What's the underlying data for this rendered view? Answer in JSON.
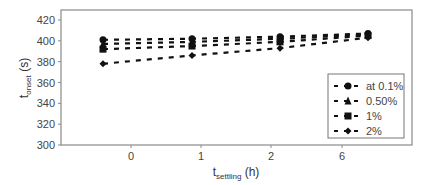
{
  "chart_data": {
    "type": "line",
    "title": "",
    "xlabel": "t_settling (h)",
    "xlabel_main": "t",
    "xlabel_sub": "settling",
    "xlabel_unit": " (h)",
    "ylabel": "t_onset (s)",
    "ylabel_main": "t",
    "ylabel_sub": "onset",
    "ylabel_unit": " (s)",
    "categories": [
      "0",
      "1",
      "2",
      "6"
    ],
    "x_tick_labels": [
      "0",
      "1",
      "2",
      "6"
    ],
    "y_ticks": [
      300,
      320,
      340,
      360,
      380,
      400,
      420
    ],
    "ylim": [
      300,
      425
    ],
    "grid": false,
    "legend_position": "right-center",
    "series": [
      {
        "name": "at 0.1%",
        "marker": "circle",
        "values": [
          401,
          402,
          404,
          407
        ]
      },
      {
        "name": "0.50%",
        "marker": "triangle",
        "values": [
          397,
          399,
          402,
          406
        ]
      },
      {
        "name": "1%",
        "marker": "square",
        "values": [
          392,
          395,
          399,
          405
        ]
      },
      {
        "name": "2%",
        "marker": "diamond",
        "values": [
          378,
          386,
          393,
          403
        ]
      }
    ]
  },
  "colors": {
    "series": "#111111",
    "axis": "#888888",
    "text": "#444444"
  }
}
